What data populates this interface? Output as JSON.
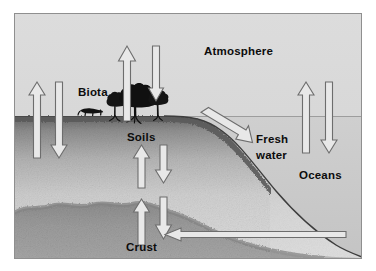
{
  "figure": {
    "title_alt": "Global biogeochemical cycle reservoirs and fluxes",
    "background_color": "#d9d9d9",
    "border_color": "#8a8a8a",
    "labels": {
      "atmosphere": "Atmosphere",
      "biota": "Biota",
      "soils": "Soils",
      "crust": "Crust",
      "fresh_water_line1": "Fresh",
      "fresh_water_line2": "water",
      "oceans": "Oceans"
    },
    "colors": {
      "sky": "#d7d7d7",
      "soil_top": "#6e6e6e",
      "soil_mid": "#c9c9c9",
      "crust": "#9a9a9a",
      "ocean_water": "#c2c2c2",
      "arrow_fill": "#e6e6e6",
      "arrow_stroke": "#6b6b6b",
      "biota_silhouette": "#121212",
      "text": "#0c0c0c"
    },
    "reservoirs": [
      {
        "name": "Atmosphere",
        "position": "upper-center"
      },
      {
        "name": "Biota",
        "position": "land-surface-left-center"
      },
      {
        "name": "Soils",
        "position": "subsurface-left-center"
      },
      {
        "name": "Crust",
        "position": "deep-bottom-center"
      },
      {
        "name": "Fresh water",
        "position": "coastal-right-of-slope"
      },
      {
        "name": "Oceans",
        "position": "right-sea"
      }
    ],
    "fluxes": [
      {
        "id": "soil-to-atmosphere",
        "direction": "up",
        "from": "Soils",
        "to": "Atmosphere"
      },
      {
        "id": "atmosphere-to-soil",
        "direction": "down",
        "from": "Atmosphere",
        "to": "Soils"
      },
      {
        "id": "biota-to-atmosphere",
        "direction": "up",
        "from": "Biota",
        "to": "Atmosphere"
      },
      {
        "id": "atmosphere-to-biota",
        "direction": "down",
        "from": "Atmosphere",
        "to": "Biota"
      },
      {
        "id": "crust-to-soils",
        "direction": "up",
        "from": "Crust",
        "to": "Soils"
      },
      {
        "id": "soils-to-crust",
        "direction": "down",
        "from": "Soils",
        "to": "Crust"
      },
      {
        "id": "soils-to-crust-deep",
        "direction": "down",
        "from": "Soils",
        "to": "Crust"
      },
      {
        "id": "crust-to-soils-deep",
        "direction": "up",
        "from": "Crust",
        "to": "Soils"
      },
      {
        "id": "land-runoff-to-fresh-water",
        "direction": "diagonal-down-right",
        "from": "Land",
        "to": "Fresh water"
      },
      {
        "id": "ocean-to-atmosphere",
        "direction": "up",
        "from": "Oceans",
        "to": "Atmosphere"
      },
      {
        "id": "atmosphere-to-ocean",
        "direction": "down",
        "from": "Atmosphere",
        "to": "Oceans"
      },
      {
        "id": "ocean-floor-to-crust",
        "direction": "left",
        "from": "Ocean floor",
        "to": "Crust"
      }
    ]
  }
}
